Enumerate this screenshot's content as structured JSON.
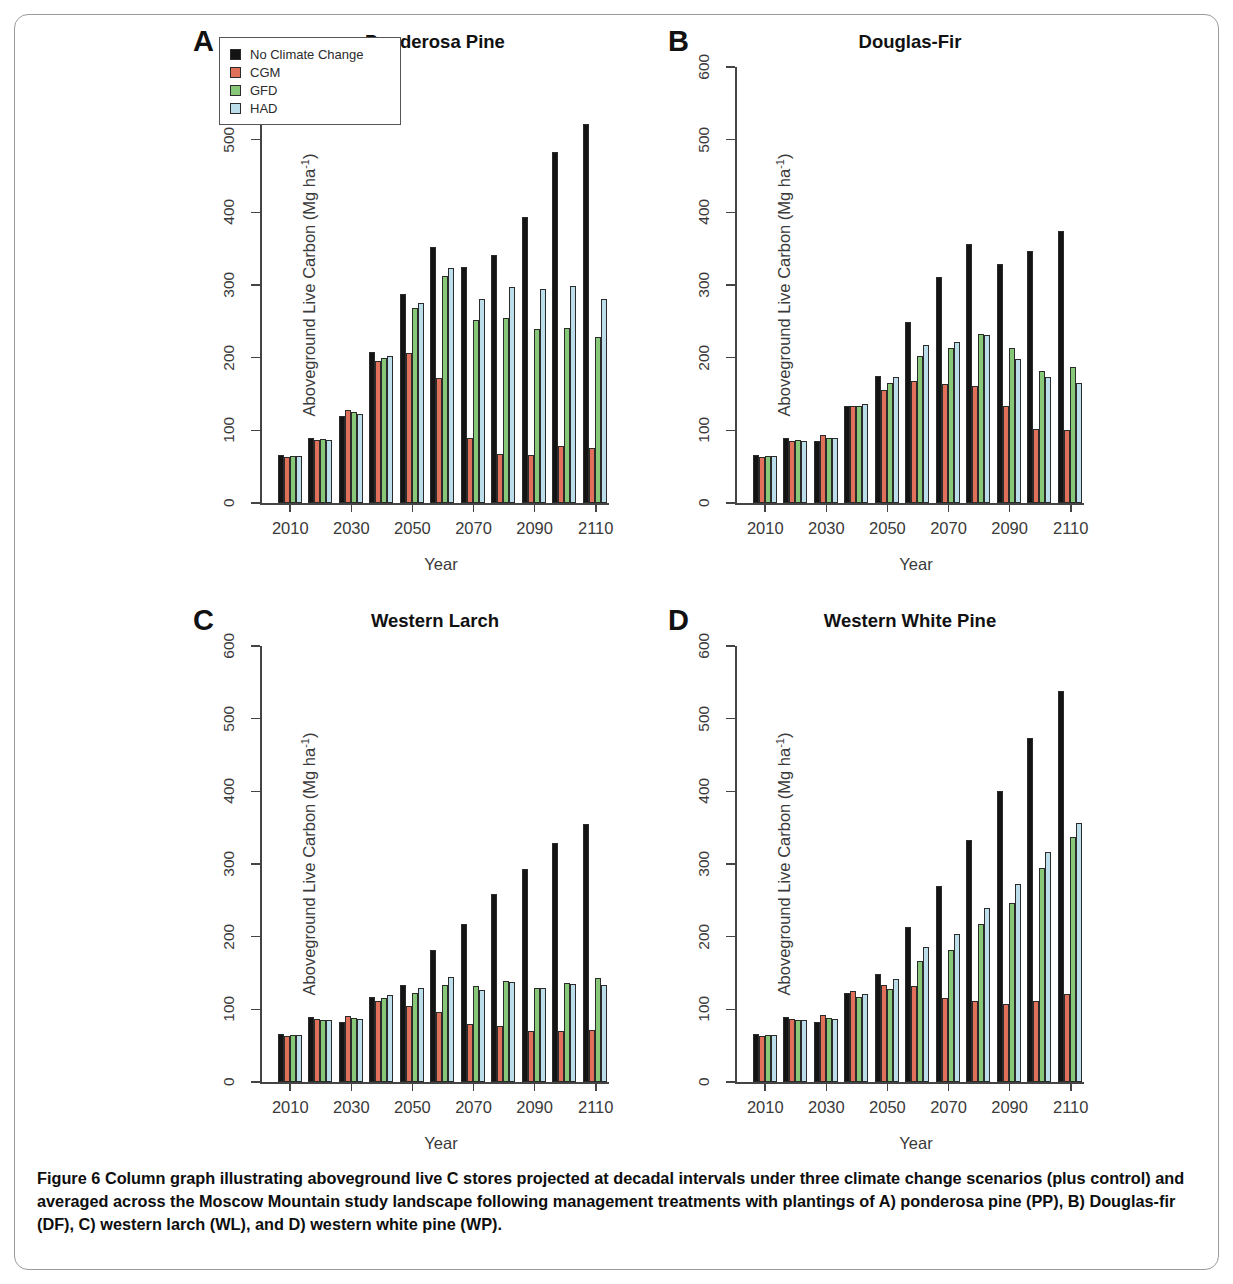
{
  "figure": {
    "caption_lead": "Figure 6",
    "caption_body": "Column graph illustrating aboveground live C stores projected at decadal intervals under three climate change scenarios (plus control) and averaged across the Moscow Mountain study landscape following management treatments with plantings of A) ponderosa pine (PP), B) Douglas-fir (DF), C) western larch (WL), and D) western white pine (WP)."
  },
  "legend": {
    "items": [
      {
        "label": "No Climate Change",
        "color": "#141414"
      },
      {
        "label": "CGM",
        "color": "#E0705A"
      },
      {
        "label": "GFD",
        "color": "#86C878"
      },
      {
        "label": "HAD",
        "color": "#BCDEEA"
      }
    ]
  },
  "axes": {
    "ylabel": "Aboveground Live Carbon (Mg ha",
    "ylabel_sup": "-1",
    "ylabel_tail": ")",
    "xlabel": "Year",
    "yticks": [
      "0",
      "100",
      "200",
      "300",
      "400",
      "500",
      "600"
    ],
    "xticks": [
      "2010",
      "2030",
      "2050",
      "2070",
      "2090",
      "2110"
    ]
  },
  "panels": [
    {
      "letter": "A",
      "title": "Ponderosa Pine"
    },
    {
      "letter": "B",
      "title": "Douglas-Fir"
    },
    {
      "letter": "C",
      "title": "Western Larch"
    },
    {
      "letter": "D",
      "title": "Western White Pine"
    }
  ],
  "chart_data": [
    {
      "type": "bar",
      "panel": "A",
      "title": "Ponderosa Pine",
      "xlabel": "Year",
      "ylabel": "Aboveground Live Carbon (Mg ha-1)",
      "ylim": [
        0,
        600
      ],
      "grid": false,
      "legend_position": "top-left",
      "categories": [
        "2010",
        "2020",
        "2030",
        "2040",
        "2050",
        "2060",
        "2070",
        "2080",
        "2090",
        "2100",
        "2110"
      ],
      "tick_categories": [
        "2010",
        "2030",
        "2050",
        "2070",
        "2090",
        "2110"
      ],
      "series": [
        {
          "name": "No Climate Change",
          "color": "#141414",
          "values": [
            66,
            90,
            120,
            208,
            287,
            353,
            325,
            341,
            393,
            483,
            522
          ]
        },
        {
          "name": "CGM",
          "color": "#E0705A",
          "values": [
            64,
            87,
            128,
            196,
            206,
            172,
            89,
            68,
            66,
            79,
            76
          ]
        },
        {
          "name": "GFD",
          "color": "#86C878",
          "values": [
            65,
            88,
            125,
            199,
            268,
            313,
            252,
            255,
            240,
            241,
            229
          ]
        },
        {
          "name": "HAD",
          "color": "#BCDEEA",
          "values": [
            65,
            87,
            123,
            203,
            275,
            323,
            281,
            297,
            294,
            299,
            281
          ]
        }
      ]
    },
    {
      "type": "bar",
      "panel": "B",
      "title": "Douglas-Fir",
      "xlabel": "Year",
      "ylabel": "Aboveground Live Carbon (Mg ha-1)",
      "ylim": [
        0,
        600
      ],
      "grid": false,
      "categories": [
        "2010",
        "2020",
        "2030",
        "2040",
        "2050",
        "2060",
        "2070",
        "2080",
        "2090",
        "2100",
        "2110"
      ],
      "tick_categories": [
        "2010",
        "2030",
        "2050",
        "2070",
        "2090",
        "2110"
      ],
      "series": [
        {
          "name": "No Climate Change",
          "color": "#141414",
          "values": [
            66,
            89,
            86,
            134,
            175,
            249,
            311,
            356,
            329,
            347,
            374
          ]
        },
        {
          "name": "CGM",
          "color": "#E0705A",
          "values": [
            64,
            86,
            94,
            133,
            156,
            168,
            164,
            161,
            133,
            102,
            100
          ]
        },
        {
          "name": "GFD",
          "color": "#86C878",
          "values": [
            65,
            87,
            90,
            133,
            165,
            202,
            213,
            233,
            213,
            181,
            187
          ]
        },
        {
          "name": "HAD",
          "color": "#BCDEEA",
          "values": [
            65,
            86,
            90,
            136,
            174,
            217,
            222,
            231,
            198,
            173,
            165
          ]
        }
      ]
    },
    {
      "type": "bar",
      "panel": "C",
      "title": "Western Larch",
      "xlabel": "Year",
      "ylabel": "Aboveground Live Carbon (Mg ha-1)",
      "ylim": [
        0,
        600
      ],
      "grid": false,
      "categories": [
        "2010",
        "2020",
        "2030",
        "2040",
        "2050",
        "2060",
        "2070",
        "2080",
        "2090",
        "2100",
        "2110"
      ],
      "tick_categories": [
        "2010",
        "2030",
        "2050",
        "2070",
        "2090",
        "2110"
      ],
      "series": [
        {
          "name": "No Climate Change",
          "color": "#141414",
          "values": [
            66,
            89,
            83,
            117,
            134,
            181,
            217,
            259,
            293,
            329,
            355
          ]
        },
        {
          "name": "CGM",
          "color": "#E0705A",
          "values": [
            63,
            87,
            91,
            112,
            104,
            96,
            80,
            77,
            70,
            70,
            71
          ]
        },
        {
          "name": "GFD",
          "color": "#86C878",
          "values": [
            65,
            86,
            88,
            115,
            122,
            133,
            132,
            139,
            130,
            136,
            143
          ]
        },
        {
          "name": "HAD",
          "color": "#BCDEEA",
          "values": [
            65,
            86,
            87,
            120,
            130,
            144,
            126,
            138,
            129,
            135,
            133
          ]
        }
      ]
    },
    {
      "type": "bar",
      "panel": "D",
      "title": "Western White Pine",
      "xlabel": "Year",
      "ylabel": "Aboveground Live Carbon (Mg ha-1)",
      "ylim": [
        0,
        600
      ],
      "grid": false,
      "categories": [
        "2010",
        "2020",
        "2030",
        "2040",
        "2050",
        "2060",
        "2070",
        "2080",
        "2090",
        "2100",
        "2110"
      ],
      "tick_categories": [
        "2010",
        "2030",
        "2050",
        "2070",
        "2090",
        "2110"
      ],
      "series": [
        {
          "name": "No Climate Change",
          "color": "#141414",
          "values": [
            66,
            89,
            83,
            122,
            149,
            213,
            270,
            333,
            400,
            474,
            538
          ]
        },
        {
          "name": "CGM",
          "color": "#E0705A",
          "values": [
            63,
            87,
            92,
            125,
            133,
            132,
            116,
            111,
            108,
            112,
            121
          ]
        },
        {
          "name": "GFD",
          "color": "#86C878",
          "values": [
            65,
            86,
            88,
            117,
            128,
            166,
            181,
            218,
            246,
            294,
            337
          ]
        },
        {
          "name": "HAD",
          "color": "#BCDEEA",
          "values": [
            65,
            86,
            87,
            121,
            142,
            186,
            204,
            240,
            273,
            317,
            356
          ]
        }
      ]
    }
  ]
}
